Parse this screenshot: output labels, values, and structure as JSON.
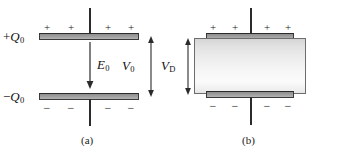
{
  "figure": {
    "colors": {
      "plate_fill_top": "#8f8f8f",
      "plate_fill_bottom": "#b4b4b4",
      "plate_stroke": "#3a3a3a",
      "lead_color": "#2b2b2b",
      "dielectric_fill_light": "#fbfbfb",
      "dielectric_fill_dark": "#d5d5d5",
      "dielectric_stroke": "#6d6d6d",
      "text_color": "#1a1a1a",
      "background": "#ffffff"
    }
  },
  "panel_a": {
    "caption": "(a)",
    "top_plate": {
      "charge_label": "+Q",
      "charge_subscript": "0",
      "charge_sign_prefix": "+",
      "surface_signs": [
        "+",
        "+",
        "+",
        "+"
      ]
    },
    "bottom_plate": {
      "charge_label": "−Q",
      "charge_subscript": "0",
      "charge_sign_prefix": "−",
      "surface_signs": [
        "−",
        "−",
        "−",
        "−"
      ]
    },
    "field_arrow": {
      "label": "E",
      "subscript": "0",
      "direction": "down",
      "heads": 1
    },
    "gap_measure": {
      "label": "V",
      "subscript": "0",
      "heads": 2,
      "orientation": "vertical"
    }
  },
  "panel_b": {
    "caption": "(b)",
    "top_plate": {
      "surface_signs": [
        "+",
        "+",
        "+",
        "+"
      ]
    },
    "bottom_plate": {
      "surface_signs": [
        "−",
        "−",
        "−",
        "−"
      ]
    },
    "gap_measure": {
      "label": "V",
      "subscript": "D",
      "heads": 2,
      "orientation": "vertical"
    },
    "dielectric": {
      "name": "dielectric-slab"
    }
  }
}
